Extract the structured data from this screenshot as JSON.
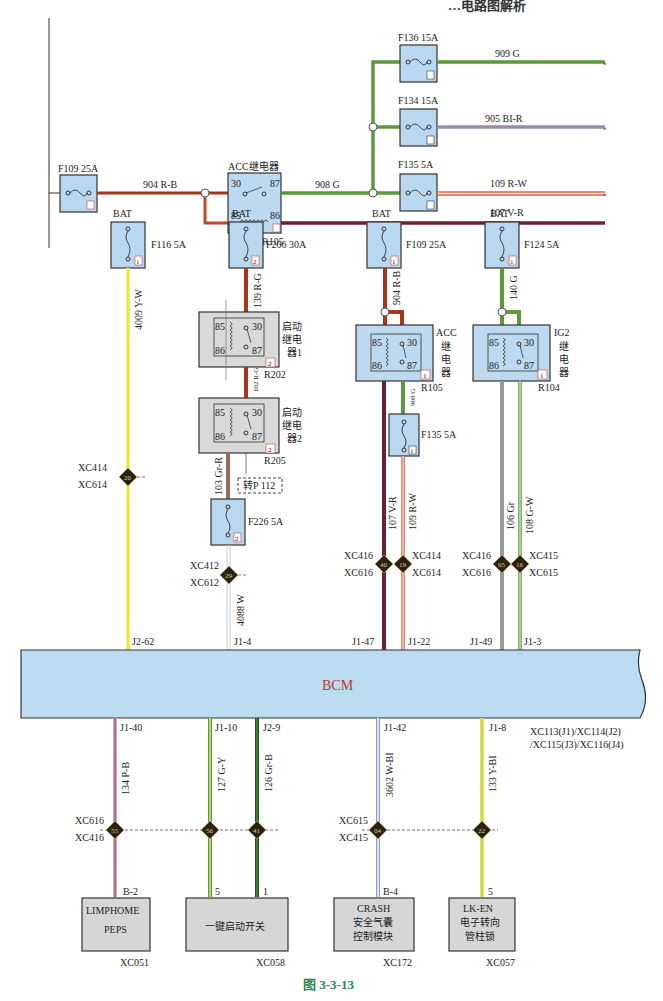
{
  "header": {
    "title_fragment": "…电路图解析"
  },
  "caption": "图 3-3-13",
  "top_section": {
    "main_fuse": {
      "id": "F109 25A"
    },
    "feed_wire": "904 R-B",
    "acc_relay": {
      "title": "ACC继电器",
      "ref": "R105",
      "pins": [
        "30",
        "87",
        "85",
        "86"
      ]
    },
    "relay_out_wire": "908 G",
    "branches": [
      {
        "fuse": "F136 15A",
        "wire": "909 G",
        "color": "#5a9a3a"
      },
      {
        "fuse": "F134 15A",
        "wire": "905 BI-R",
        "color": "#9c8aab"
      },
      {
        "fuse": "F135 5A",
        "wire": "109 R-W",
        "color": "#e06040"
      }
    ],
    "coil_wire": "107 V-R"
  },
  "supply_columns": [
    {
      "source": "BAT",
      "fuse": "F116 5A",
      "fuse_box": "1",
      "wire": "4009 Y-W",
      "connector_top": "XC414",
      "connector_bottom": "XC614",
      "splice": "20",
      "pin": "J2-62"
    },
    {
      "source": "BAT",
      "fuse": "F206 30A",
      "fuse_box": "2",
      "wire": "139 R-G",
      "relay1": {
        "label": [
          "启动",
          "继电",
          "器1"
        ],
        "ref": "R202",
        "box": "2"
      },
      "link_wire": "102 R-G",
      "relay2": {
        "label": [
          "启动",
          "继电",
          "器2"
        ],
        "ref": "R205",
        "box": "2"
      },
      "relay2_out_wire": "103 Gr-R",
      "cross_ref": "转P 112",
      "fuse2": "F226 5A",
      "fuse2_box": "2",
      "out_wire": "4088 W",
      "connector_top": "XC412",
      "connector_bottom": "XC612",
      "splice": "29",
      "pin": "J1-4"
    },
    {
      "source": "BAT",
      "fuse": "F109 25A",
      "fuse_box": "1",
      "wire": "904 R-B",
      "relay": {
        "label": [
          "ACC",
          "继",
          "电",
          "器"
        ],
        "ref": "R105",
        "box": "1"
      },
      "relay_out_wire": "908 G",
      "fuse2": "F135 5A",
      "fuse2_box": "1",
      "wires": [
        {
          "wire": "107 V-R",
          "connector_top": "XC416",
          "connector_bottom": "XC616",
          "splice": "40",
          "pin": "J1-47"
        },
        {
          "wire": "109 R-W",
          "connector_top": "XC414",
          "connector_bottom": "XC614",
          "splice": "19",
          "pin": "J1-22"
        }
      ]
    },
    {
      "source": "BAT",
      "fuse": "F124 5A",
      "fuse_box": "1",
      "wire": "140 G",
      "relay": {
        "label": [
          "IG2",
          "继",
          "电",
          "器"
        ],
        "ref": "R104",
        "box": "1"
      },
      "wires": [
        {
          "wire": "106 Gr",
          "connector_top": "XC416",
          "connector_bottom": "XC616",
          "splice": "05",
          "pin": "J1-49"
        },
        {
          "wire": "108 G-W",
          "connector_top": "XC415",
          "connector_bottom": "XC615",
          "splice": "16",
          "pin": "J1-3"
        }
      ]
    }
  ],
  "bcm": {
    "label": "BCM",
    "connectors": [
      "XC113(J1)/XC114(J2)",
      "/XC115(J3)/XC116(J4)"
    ]
  },
  "outputs": [
    {
      "pin": "J1-40",
      "wire": "134 P-B",
      "splice": "55",
      "module_pin": "B-2",
      "module": [
        "LIMPHOME",
        "PEPS"
      ],
      "connector": "XC051"
    },
    {
      "pin": "J1-10",
      "wire": "127 G-Y",
      "splice": "56",
      "module_pin": "5",
      "module": [
        "一键启动开关"
      ],
      "connector": "XC058"
    },
    {
      "pin": "J2-9",
      "wire": "126 Gr-B",
      "splice": "41",
      "module_pin": "1"
    },
    {
      "pin": "J1-42",
      "wire": "3602 W-BI",
      "splice": "04",
      "module_pin": "B-4",
      "module": [
        "CRASH",
        "安全气囊",
        "控制模块"
      ],
      "connector": "XC172"
    },
    {
      "pin": "J1-8",
      "wire": "133 Y-BI",
      "splice": "22",
      "module_pin": "5",
      "module": [
        "LK-EN",
        "电子转向",
        "管柱锁"
      ],
      "connector": "XC057"
    }
  ],
  "output_connectors": {
    "top_left": "XC616",
    "bottom_left": "XC416",
    "top_right": "XC615",
    "bottom_right": "XC415"
  }
}
